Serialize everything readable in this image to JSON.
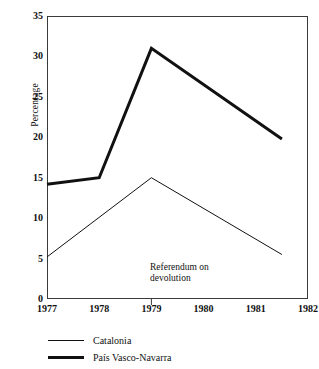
{
  "chart_data": {
    "type": "line",
    "title": "",
    "subtitle": "",
    "xlabel": "",
    "ylabel": "Percentage",
    "xlim": [
      1977,
      1982
    ],
    "ylim": [
      0,
      35
    ],
    "grid": false,
    "legend_position": "bottom-left",
    "x_ticks": [
      "1977",
      "1978",
      "1979",
      "1980",
      "1981",
      "1982"
    ],
    "y_ticks": [
      "0",
      "5",
      "10",
      "15",
      "20",
      "25",
      "30",
      "35"
    ],
    "annotations": [
      {
        "text": "Referendum on\ndevolution",
        "x": 1979,
        "marker": "tick-below-axis"
      }
    ],
    "series": [
      {
        "name": "Catalonia",
        "style": "thin",
        "color": "#111111",
        "points": [
          {
            "x": 1977.0,
            "y": 5.2
          },
          {
            "x": 1979.0,
            "y": 15.0
          },
          {
            "x": 1981.5,
            "y": 5.5
          }
        ]
      },
      {
        "name": "País Vasco-Navarra",
        "style": "thick",
        "color": "#111111",
        "points": [
          {
            "x": 1977.0,
            "y": 14.2
          },
          {
            "x": 1978.0,
            "y": 15.0
          },
          {
            "x": 1979.0,
            "y": 31.0
          },
          {
            "x": 1981.5,
            "y": 19.8
          }
        ]
      }
    ]
  },
  "legend": {
    "items": [
      {
        "label": "Catalonia",
        "style": "thin"
      },
      {
        "label": "País Vasco-Navarra",
        "style": "thick"
      }
    ]
  },
  "colors": {
    "ink": "#111111",
    "axis": "#3a3a3a",
    "paper": "#ffffff"
  }
}
